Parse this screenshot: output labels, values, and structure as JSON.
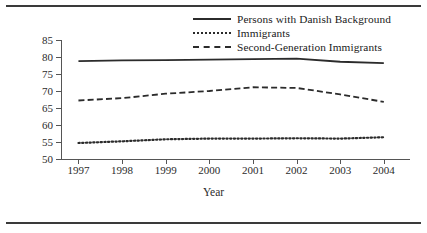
{
  "figure": {
    "rule_top": "horizontal-rule",
    "rule_bottom": "horizontal-rule"
  },
  "chart_data": {
    "type": "line",
    "title": "",
    "xlabel": "Year",
    "ylabel": "Percentage",
    "categories": [
      "1997",
      "1998",
      "1999",
      "2000",
      "2001",
      "2002",
      "2003",
      "2004"
    ],
    "x": [
      1997,
      1998,
      1999,
      2000,
      2001,
      2002,
      2003,
      2004
    ],
    "xlim": [
      1996.6,
      2004.6
    ],
    "ylim": [
      50,
      85
    ],
    "yticks": [
      50,
      55,
      60,
      65,
      70,
      75,
      80,
      85
    ],
    "ytick_labels": [
      "50",
      "55",
      "60",
      "65",
      "70",
      "75",
      "80",
      "85"
    ],
    "grid": false,
    "legend_position": "top-right",
    "series": [
      {
        "name": "Persons with Danish Background",
        "style": "solid",
        "color": "#2b2b2b",
        "values": [
          78.8,
          79.0,
          79.1,
          79.2,
          79.4,
          79.5,
          78.6,
          78.2
        ]
      },
      {
        "name": "Immigrants",
        "style": "dotted",
        "color": "#2b2b2b",
        "values": [
          54.7,
          55.2,
          55.8,
          56.0,
          56.0,
          56.1,
          56.0,
          56.4
        ]
      },
      {
        "name": "Second-Generation Immigrants",
        "style": "dashed",
        "color": "#2b2b2b",
        "values": [
          67.2,
          67.9,
          69.2,
          70.0,
          71.1,
          70.9,
          69.0,
          66.8
        ]
      }
    ]
  }
}
